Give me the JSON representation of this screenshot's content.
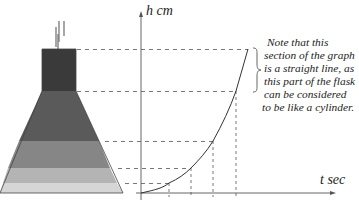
{
  "diagram": {
    "flask_layers": [
      {
        "name": "neck",
        "color": "#3a3a3a"
      },
      {
        "name": "upper-cone",
        "color": "#5a5a5a"
      },
      {
        "name": "middle-cone",
        "color": "#868686"
      },
      {
        "name": "lower-cone",
        "color": "#b4b4b4"
      },
      {
        "name": "bottom-cone",
        "color": "#d6d6d6"
      }
    ],
    "y_axis_label": "h cm",
    "x_axis_label": "t sec",
    "note_lines": [
      "Note that this",
      "section of the graph",
      "is a straight line, as",
      "this part of the flask",
      "can be considered",
      "to be like a cylinder."
    ]
  }
}
